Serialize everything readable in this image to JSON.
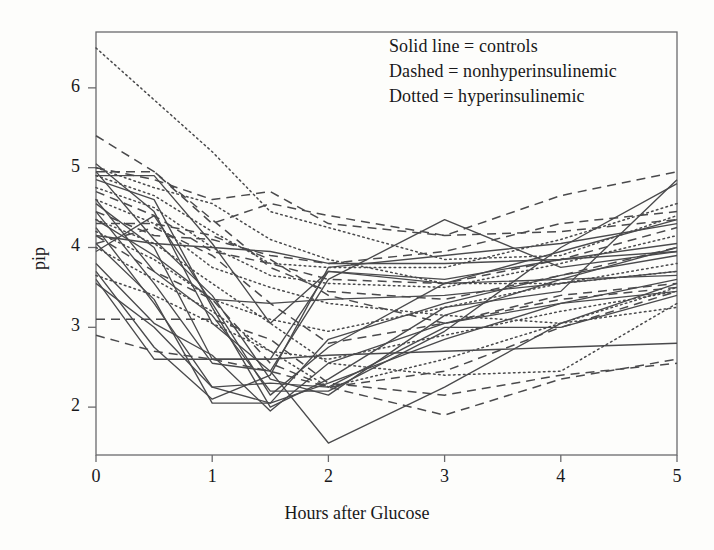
{
  "chart_data": {
    "type": "line",
    "title": "",
    "xlabel": "Hours after Glucose",
    "ylabel": "pip",
    "xlim": [
      0,
      5
    ],
    "ylim": [
      1.4,
      6.7
    ],
    "xticks": [
      0,
      1,
      2,
      3,
      4,
      5
    ],
    "yticks": [
      2,
      3,
      4,
      5,
      6
    ],
    "xtick_labels": [
      "0",
      "1",
      "2",
      "3",
      "4",
      "5"
    ],
    "ytick_labels": [
      "2",
      "3",
      "4",
      "5",
      "6"
    ],
    "grid": false,
    "frame": true,
    "legend": {
      "position": "top-right",
      "box": false,
      "entries": [
        "Solid  line = controls",
        "Dashed = nonhyperinsulinemic",
        "Dotted = hyperinsulinemic"
      ]
    },
    "x": [
      0,
      0.5,
      1,
      1.5,
      2,
      3,
      4,
      5
    ],
    "series": [
      {
        "name": "control-01",
        "style": "solid",
        "values": [
          5.05,
          4.45,
          3.05,
          2.45,
          1.55,
          2.25,
          3.05,
          3.55
        ]
      },
      {
        "name": "control-02",
        "style": "solid",
        "values": [
          4.95,
          4.1,
          3.4,
          2.35,
          2.15,
          3.15,
          3.6,
          4.0
        ]
      },
      {
        "name": "control-03",
        "style": "solid",
        "values": [
          4.85,
          4.6,
          3.25,
          2.0,
          2.35,
          3.25,
          3.45,
          4.85
        ]
      },
      {
        "name": "control-04",
        "style": "solid",
        "values": [
          4.55,
          4.0,
          2.6,
          2.6,
          3.7,
          3.55,
          3.95,
          4.35
        ]
      },
      {
        "name": "control-05",
        "style": "solid",
        "values": [
          4.45,
          3.55,
          2.55,
          2.45,
          3.6,
          4.35,
          3.75,
          3.95
        ]
      },
      {
        "name": "control-06",
        "style": "solid",
        "values": [
          4.35,
          3.9,
          3.35,
          3.3,
          3.35,
          3.4,
          3.55,
          3.7
        ]
      },
      {
        "name": "control-07",
        "style": "solid",
        "values": [
          4.25,
          3.3,
          2.25,
          2.05,
          2.85,
          3.3,
          3.65,
          3.9
        ]
      },
      {
        "name": "control-08",
        "style": "solid",
        "values": [
          4.15,
          4.05,
          4.0,
          3.95,
          3.8,
          3.8,
          3.85,
          3.95
        ]
      },
      {
        "name": "control-09",
        "style": "solid",
        "values": [
          4.05,
          3.35,
          2.05,
          2.05,
          2.3,
          2.85,
          3.3,
          3.6
        ]
      },
      {
        "name": "control-10",
        "style": "solid",
        "values": [
          3.8,
          3.05,
          2.65,
          1.95,
          2.55,
          3.05,
          3.3,
          3.45
        ]
      },
      {
        "name": "control-11",
        "style": "solid",
        "values": [
          3.7,
          2.75,
          2.1,
          2.4,
          3.75,
          3.9,
          4.05,
          4.3
        ]
      },
      {
        "name": "control-12",
        "style": "solid",
        "values": [
          3.6,
          2.6,
          2.6,
          2.6,
          2.65,
          2.7,
          2.75,
          2.8
        ]
      },
      {
        "name": "control-13",
        "style": "solid",
        "values": [
          3.55,
          3.0,
          2.25,
          2.3,
          2.25,
          3.0,
          3.0,
          3.4
        ]
      },
      {
        "name": "control-14",
        "style": "solid",
        "values": [
          4.6,
          3.7,
          3.15,
          2.2,
          2.2,
          2.95,
          4.0,
          4.8
        ]
      },
      {
        "name": "control-15",
        "style": "solid",
        "values": [
          4.9,
          4.9,
          4.05,
          3.05,
          3.7,
          3.6,
          3.85,
          4.05
        ]
      },
      {
        "name": "control-16",
        "style": "solid",
        "values": [
          3.95,
          4.4,
          3.3,
          2.15,
          2.75,
          3.55,
          3.6,
          3.65
        ]
      },
      {
        "name": "nonhyper-01",
        "style": "dashed",
        "values": [
          5.4,
          4.95,
          4.3,
          4.55,
          4.4,
          4.15,
          4.65,
          4.95
        ]
      },
      {
        "name": "nonhyper-02",
        "style": "dashed",
        "values": [
          5.0,
          4.85,
          4.6,
          4.7,
          4.3,
          4.15,
          4.2,
          4.35
        ]
      },
      {
        "name": "nonhyper-03",
        "style": "dashed",
        "values": [
          4.7,
          4.4,
          3.95,
          3.8,
          3.6,
          3.55,
          3.85,
          4.25
        ]
      },
      {
        "name": "nonhyper-04",
        "style": "dashed",
        "values": [
          4.3,
          4.3,
          4.15,
          3.85,
          3.4,
          3.05,
          3.4,
          3.55
        ]
      },
      {
        "name": "nonhyper-05",
        "style": "dashed",
        "values": [
          4.15,
          3.7,
          3.35,
          2.55,
          2.25,
          2.45,
          3.0,
          3.45
        ]
      },
      {
        "name": "nonhyper-06",
        "style": "dashed",
        "values": [
          3.1,
          3.1,
          3.1,
          2.85,
          2.3,
          2.15,
          2.4,
          2.55
        ]
      },
      {
        "name": "nonhyper-07",
        "style": "dashed",
        "values": [
          2.9,
          2.7,
          2.6,
          2.45,
          2.25,
          1.9,
          2.35,
          2.6
        ]
      },
      {
        "name": "nonhyper-08",
        "style": "dashed",
        "values": [
          4.95,
          4.95,
          4.35,
          3.75,
          3.45,
          3.35,
          3.65,
          4.0
        ]
      },
      {
        "name": "nonhyper-09",
        "style": "dashed",
        "values": [
          4.45,
          4.15,
          4.1,
          3.9,
          3.8,
          3.95,
          4.3,
          4.45
        ]
      },
      {
        "name": "nonhyper-10",
        "style": "dashed",
        "values": [
          4.05,
          4.25,
          3.9,
          3.3,
          2.8,
          3.05,
          3.35,
          3.5
        ]
      },
      {
        "name": "hyper-01",
        "style": "dotted",
        "values": [
          6.5,
          5.85,
          5.2,
          4.45,
          4.25,
          3.85,
          3.9,
          4.4
        ]
      },
      {
        "name": "hyper-02",
        "style": "dotted",
        "values": [
          5.0,
          4.75,
          4.55,
          4.1,
          3.85,
          3.55,
          3.55,
          3.7
        ]
      },
      {
        "name": "hyper-03",
        "style": "dotted",
        "values": [
          4.9,
          4.65,
          4.2,
          3.8,
          3.75,
          3.75,
          4.1,
          4.55
        ]
      },
      {
        "name": "hyper-04",
        "style": "dotted",
        "values": [
          4.6,
          4.3,
          3.75,
          3.5,
          3.3,
          3.15,
          3.05,
          3.25
        ]
      },
      {
        "name": "hyper-05",
        "style": "dotted",
        "values": [
          4.35,
          4.05,
          3.55,
          3.05,
          2.55,
          2.4,
          2.45,
          3.3
        ]
      },
      {
        "name": "hyper-06",
        "style": "dotted",
        "values": [
          4.0,
          3.6,
          3.2,
          2.7,
          2.25,
          2.6,
          3.05,
          3.5
        ]
      },
      {
        "name": "hyper-07",
        "style": "dotted",
        "values": [
          4.75,
          4.5,
          4.0,
          3.65,
          3.55,
          3.5,
          3.8,
          4.15
        ]
      },
      {
        "name": "hyper-08",
        "style": "dotted",
        "values": [
          4.2,
          3.85,
          3.35,
          3.1,
          2.95,
          3.25,
          3.55,
          3.8
        ]
      },
      {
        "name": "hyper-09",
        "style": "dotted",
        "values": [
          3.65,
          3.4,
          3.05,
          2.7,
          2.6,
          2.9,
          3.2,
          3.45
        ]
      }
    ],
    "style_colors": {
      "line": "#4a4a4c",
      "axis": "#6a6a6c",
      "text": "#18181a",
      "background": "#fdfdfb"
    }
  }
}
